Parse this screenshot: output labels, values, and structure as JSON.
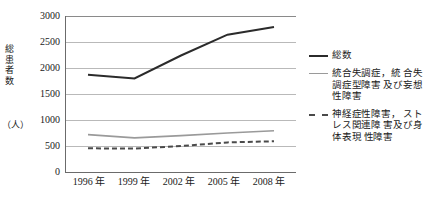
{
  "chart_data": {
    "type": "line",
    "title": "",
    "xlabel": "",
    "ylabel": "総患者数（人）",
    "ylabel_chars": [
      "総",
      "患",
      "者",
      "数"
    ],
    "yunit": "（人）",
    "categories": [
      "1996 年",
      "1999 年",
      "2002 年",
      "2005 年",
      "2008 年"
    ],
    "x_values": [
      1996,
      1999,
      2002,
      2005,
      2008
    ],
    "ylim": [
      0,
      3000
    ],
    "ytick_labels": [
      "3000",
      "2500",
      "2000",
      "1500",
      "1000",
      "500",
      "0"
    ],
    "ytick_values": [
      3000,
      2500,
      2000,
      1500,
      1000,
      500,
      0
    ],
    "grid": true,
    "legend_position": "right",
    "series": [
      {
        "name": "総数",
        "values": [
          1870,
          1800,
          2240,
          2640,
          2790
        ],
        "color": "#2b2b2b",
        "style": "solid"
      },
      {
        "name": "統合失調症，統合失調症型障害及び妄想性障害",
        "values": [
          720,
          655,
          700,
          750,
          795
        ],
        "color": "#9a9a9a",
        "style": "solid"
      },
      {
        "name": "神経症性障害，ストレス関連障害及び身体表現性障害",
        "values": [
          455,
          450,
          500,
          570,
          590
        ],
        "color": "#4a4a4a",
        "style": "dashed"
      }
    ]
  },
  "legend": {
    "items": [
      {
        "label": "総数",
        "swatch": "line-solid-dark-icon"
      },
      {
        "label": "統合失調症，統\n合失調症型障害\n及び妄想性障害",
        "swatch": "line-solid-gray-icon"
      },
      {
        "label": "神経症性障害，\nストレス関連障\n害及び身体表現\n性障害",
        "swatch": "line-dashed-icon"
      }
    ]
  }
}
